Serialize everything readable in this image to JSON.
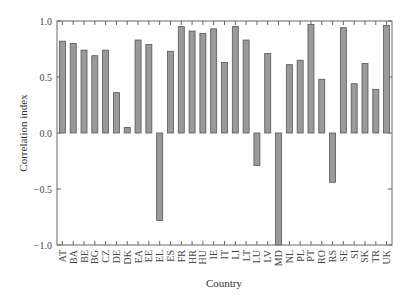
{
  "chart_data": {
    "type": "bar",
    "title": "",
    "xlabel": "Country",
    "ylabel": "Correlation index",
    "ylim": [
      -1.0,
      1.0
    ],
    "yticks": [
      -1.0,
      -0.5,
      0.0,
      0.5,
      1.0
    ],
    "ytick_labels": [
      "−1.0",
      "−0.5",
      "0.0",
      "0.5",
      "1.0"
    ],
    "grid": false,
    "legend": null,
    "categories": [
      "AT",
      "BA",
      "BE",
      "BG",
      "CZ",
      "DE",
      "DK",
      "EA",
      "EE",
      "EL",
      "ES",
      "FR",
      "HR",
      "HU",
      "IE",
      "IT",
      "LI",
      "LT",
      "LU",
      "LV",
      "MD",
      "NL",
      "PL",
      "PT",
      "RO",
      "RS",
      "SE",
      "SI",
      "SK",
      "TR",
      "UK"
    ],
    "values": [
      0.82,
      0.8,
      0.74,
      0.69,
      0.74,
      0.36,
      0.05,
      0.83,
      0.79,
      -0.78,
      0.73,
      0.95,
      0.91,
      0.89,
      0.93,
      0.63,
      0.95,
      0.83,
      -0.29,
      0.71,
      -1.0,
      0.61,
      0.65,
      0.97,
      0.48,
      -0.44,
      0.94,
      0.44,
      0.62,
      0.39,
      0.96
    ],
    "colors": {
      "bar_fill": "#9a9a9a",
      "bar_edge": "#555555",
      "axis": "#666666"
    }
  }
}
